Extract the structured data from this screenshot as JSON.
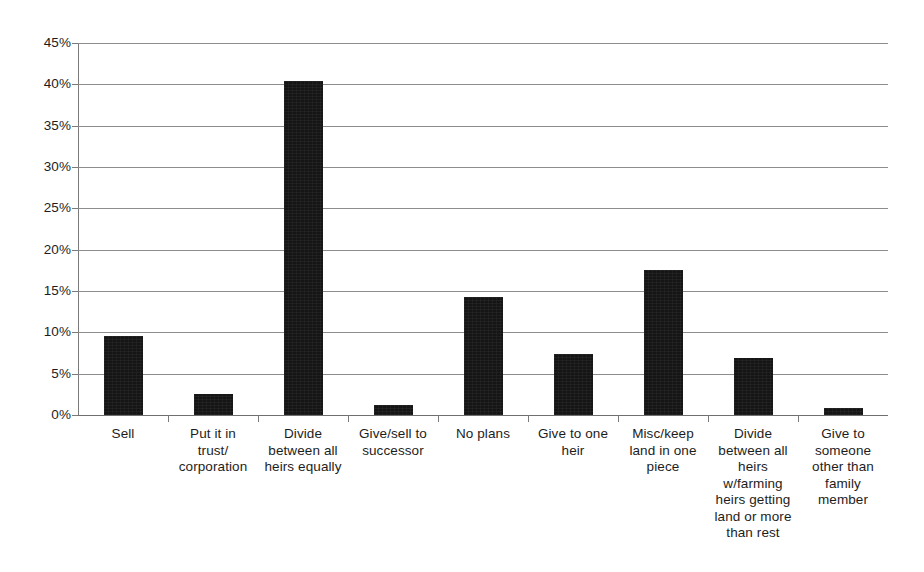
{
  "chart_data": {
    "type": "bar",
    "title": "",
    "subtitle": "",
    "xlabel": "",
    "ylabel": "",
    "ylim": [
      0,
      45
    ],
    "ytick_labels": [
      "0%",
      "5%",
      "10%",
      "15%",
      "20%",
      "25%",
      "30%",
      "35%",
      "40%",
      "45%"
    ],
    "ytick_values": [
      0,
      5,
      10,
      15,
      20,
      25,
      30,
      35,
      40,
      45
    ],
    "grid": true,
    "legend": false,
    "legend_position": "none",
    "value_unit": "percent",
    "bar_color": "#151515",
    "gridline_color": "#8d8d8d",
    "axis_color": "#7a7a7a",
    "background_color": "#ffffff",
    "categories": [
      "Sell",
      "Put it in trust/ corporation",
      "Divide between all heirs equally",
      "Give/sell to successor",
      "No plans",
      "Give to one heir",
      "Misc/keep land in one piece",
      "Divide between all heirs w/farming heirs getting land or more than rest",
      "Give to someone other than family member"
    ],
    "category_labels_wrapped": [
      "Sell",
      "Put it in\ntrust/\ncorporation",
      "Divide\nbetween all\nheirs equally",
      "Give/sell to\nsuccessor",
      "No plans",
      "Give to one\nheir",
      "Misc/keep\nland in one\npiece",
      "Divide\nbetween all\nheirs\nw/farming\nheirs getting\nland or more\nthan rest",
      "Give to\nsomeone\nother than\nfamily\nmember"
    ],
    "values": [
      9.5,
      2.5,
      40.4,
      1.2,
      14.3,
      7.4,
      17.6,
      6.9,
      0.8
    ]
  }
}
